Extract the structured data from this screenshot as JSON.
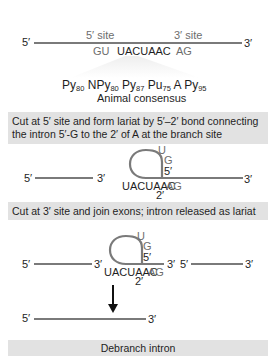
{
  "diagram": {
    "pre_mrna": {
      "label_5prime": "5′",
      "label_3prime": "3′",
      "site_5_label": "5′ site",
      "site_3_label": "3′ site",
      "gu": "GU",
      "branch": "UACUAAC",
      "ag": "AG"
    },
    "consensus": {
      "terms": [
        {
          "base": "Py",
          "sub": "80"
        },
        {
          "base": "N",
          "sub": ""
        },
        {
          "base": "Py",
          "sub": "80"
        },
        {
          "base": "Py",
          "sub": "87"
        },
        {
          "base": "Pu",
          "sub": "75"
        },
        {
          "base": "A",
          "sub": ""
        },
        {
          "base": "Py",
          "sub": "95"
        }
      ],
      "caption": "Animal consensus"
    },
    "step1": {
      "text_line1": "Cut at 5′ site and form lariat by 5′–2′ bond connecting",
      "text_line2": "the intron 5′-G to the 2′ of A at the branch site"
    },
    "lariat1": {
      "exon1_5": "5′",
      "exon1_3": "3′",
      "u": "U",
      "g": "G",
      "loop_5": "5′",
      "branch": "UACUAAC",
      "ag": "AG",
      "two_prime": "2′",
      "end_3": "3′"
    },
    "step2": {
      "text": "Cut at 3′ site and  join exons; intron released as lariat"
    },
    "lariat2": {
      "exon1_5": "5′",
      "exon1_3": "3′",
      "u": "U",
      "g": "G",
      "loop_5": "5′",
      "intron_3": "3′",
      "exon2_5": "5′",
      "exon2_3": "3′",
      "branch": "UACUAAC",
      "ag": "AG",
      "two_prime": "2′"
    },
    "spliced": {
      "label_5prime": "5′",
      "label_3prime": "3′"
    },
    "step3": {
      "text": "Debranch intron"
    },
    "colors": {
      "strand": "#7a7a7a",
      "box_bg": "#e2e2e2",
      "gray_text": "#6d6d6d",
      "dark_text": "#1e1e1e"
    }
  }
}
